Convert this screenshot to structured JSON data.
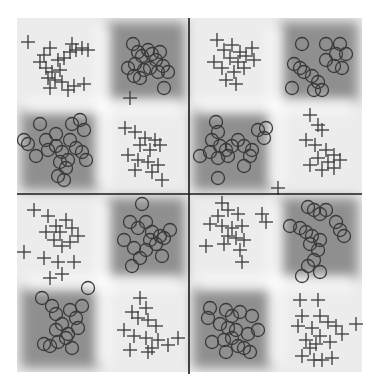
{
  "chart_data": {
    "type": "scatter",
    "title": "",
    "xlabel": "",
    "ylabel": "",
    "grid": false,
    "legend": null,
    "background": "decision-region heatmap (grayscale)",
    "colors": {
      "region_dark": "#8f8f8f",
      "region_light": "#ececec",
      "boundary_light": "#ffffff",
      "marker": "#3a3a3a",
      "divider": "#1a1a1a"
    },
    "plot_box": {
      "x0": 17,
      "y0": 18,
      "x1": 362,
      "y1": 372
    },
    "dividers": {
      "vertical_x": 189,
      "horizontal_y": 194
    },
    "series": [
      {
        "name": "class-plus",
        "marker": "plus",
        "points": [
          [
            28,
            42
          ],
          [
            44,
            55
          ],
          [
            50,
            48
          ],
          [
            58,
            60
          ],
          [
            46,
            68
          ],
          [
            52,
            72
          ],
          [
            60,
            70
          ],
          [
            64,
            58
          ],
          [
            70,
            52
          ],
          [
            76,
            50
          ],
          [
            82,
            48
          ],
          [
            88,
            50
          ],
          [
            72,
            44
          ],
          [
            40,
            62
          ],
          [
            48,
            78
          ],
          [
            55,
            80
          ],
          [
            62,
            82
          ],
          [
            50,
            88
          ],
          [
            68,
            90
          ],
          [
            74,
            86
          ],
          [
            84,
            84
          ],
          [
            130,
            98
          ],
          [
            125,
            128
          ],
          [
            135,
            132
          ],
          [
            145,
            138
          ],
          [
            155,
            140
          ],
          [
            140,
            145
          ],
          [
            150,
            150
          ],
          [
            160,
            145
          ],
          [
            128,
            155
          ],
          [
            138,
            160
          ],
          [
            148,
            162
          ],
          [
            158,
            165
          ],
          [
            135,
            170
          ],
          [
            152,
            172
          ],
          [
            162,
            180
          ],
          [
            217,
            40
          ],
          [
            224,
            50
          ],
          [
            232,
            45
          ],
          [
            240,
            52
          ],
          [
            230,
            58
          ],
          [
            238,
            62
          ],
          [
            246,
            56
          ],
          [
            214,
            62
          ],
          [
            222,
            68
          ],
          [
            234,
            72
          ],
          [
            244,
            68
          ],
          [
            226,
            80
          ],
          [
            236,
            84
          ],
          [
            252,
            48
          ],
          [
            254,
            60
          ],
          [
            310,
            115
          ],
          [
            318,
            125
          ],
          [
            322,
            130
          ],
          [
            306,
            140
          ],
          [
            315,
            145
          ],
          [
            326,
            150
          ],
          [
            334,
            155
          ],
          [
            318,
            158
          ],
          [
            328,
            162
          ],
          [
            310,
            165
          ],
          [
            322,
            170
          ],
          [
            334,
            168
          ],
          [
            340,
            160
          ],
          [
            278,
            188
          ],
          [
            34,
            210
          ],
          [
            48,
            216
          ],
          [
            56,
            226
          ],
          [
            60,
            232
          ],
          [
            66,
            220
          ],
          [
            72,
            228
          ],
          [
            78,
            236
          ],
          [
            46,
            232
          ],
          [
            54,
            240
          ],
          [
            62,
            246
          ],
          [
            70,
            242
          ],
          [
            24,
            252
          ],
          [
            44,
            258
          ],
          [
            58,
            262
          ],
          [
            74,
            262
          ],
          [
            50,
            278
          ],
          [
            62,
            274
          ],
          [
            140,
            298
          ],
          [
            146,
            308
          ],
          [
            132,
            312
          ],
          [
            138,
            318
          ],
          [
            148,
            320
          ],
          [
            156,
            326
          ],
          [
            124,
            330
          ],
          [
            134,
            336
          ],
          [
            146,
            338
          ],
          [
            158,
            340
          ],
          [
            168,
            345
          ],
          [
            130,
            350
          ],
          [
            148,
            352
          ],
          [
            152,
            348
          ],
          [
            178,
            338
          ],
          [
            222,
            203
          ],
          [
            218,
            216
          ],
          [
            228,
            210
          ],
          [
            238,
            214
          ],
          [
            210,
            224
          ],
          [
            222,
            226
          ],
          [
            232,
            228
          ],
          [
            242,
            226
          ],
          [
            228,
            236
          ],
          [
            236,
            238
          ],
          [
            244,
            240
          ],
          [
            206,
            246
          ],
          [
            224,
            244
          ],
          [
            240,
            250
          ],
          [
            262,
            214
          ],
          [
            266,
            222
          ],
          [
            242,
            262
          ],
          [
            300,
            300
          ],
          [
            318,
            300
          ],
          [
            302,
            316
          ],
          [
            320,
            316
          ],
          [
            328,
            322
          ],
          [
            336,
            326
          ],
          [
            298,
            326
          ],
          [
            312,
            328
          ],
          [
            320,
            336
          ],
          [
            306,
            340
          ],
          [
            316,
            344
          ],
          [
            330,
            342
          ],
          [
            342,
            334
          ],
          [
            356,
            324
          ],
          [
            302,
            356
          ],
          [
            314,
            360
          ],
          [
            322,
            360
          ],
          [
            332,
            358
          ],
          [
            310,
            348
          ]
        ]
      },
      {
        "name": "class-circle",
        "marker": "circle",
        "points": [
          [
            133,
            44
          ],
          [
            138,
            52
          ],
          [
            142,
            56
          ],
          [
            148,
            50
          ],
          [
            152,
            54
          ],
          [
            156,
            60
          ],
          [
            160,
            52
          ],
          [
            163,
            66
          ],
          [
            135,
            64
          ],
          [
            128,
            68
          ],
          [
            144,
            70
          ],
          [
            150,
            68
          ],
          [
            158,
            72
          ],
          [
            134,
            76
          ],
          [
            140,
            78
          ],
          [
            168,
            72
          ],
          [
            164,
            88
          ],
          [
            40,
            124
          ],
          [
            24,
            140
          ],
          [
            28,
            144
          ],
          [
            46,
            140
          ],
          [
            56,
            134
          ],
          [
            72,
            124
          ],
          [
            80,
            120
          ],
          [
            84,
            130
          ],
          [
            48,
            150
          ],
          [
            56,
            146
          ],
          [
            62,
            152
          ],
          [
            68,
            160
          ],
          [
            60,
            162
          ],
          [
            76,
            148
          ],
          [
            82,
            152
          ],
          [
            70,
            140
          ],
          [
            86,
            160
          ],
          [
            66,
            168
          ],
          [
            58,
            176
          ],
          [
            64,
            180
          ],
          [
            36,
            156
          ],
          [
            302,
            44
          ],
          [
            326,
            44
          ],
          [
            340,
            44
          ],
          [
            336,
            54
          ],
          [
            346,
            54
          ],
          [
            326,
            60
          ],
          [
            334,
            66
          ],
          [
            342,
            68
          ],
          [
            294,
            64
          ],
          [
            300,
            68
          ],
          [
            304,
            72
          ],
          [
            312,
            76
          ],
          [
            318,
            82
          ],
          [
            314,
            90
          ],
          [
            292,
            88
          ],
          [
            322,
            90
          ],
          [
            216,
            122
          ],
          [
            218,
            132
          ],
          [
            212,
            140
          ],
          [
            220,
            146
          ],
          [
            226,
            150
          ],
          [
            232,
            146
          ],
          [
            238,
            140
          ],
          [
            244,
            146
          ],
          [
            252,
            150
          ],
          [
            258,
            130
          ],
          [
            266,
            128
          ],
          [
            264,
            138
          ],
          [
            200,
            156
          ],
          [
            210,
            152
          ],
          [
            218,
            158
          ],
          [
            228,
            156
          ],
          [
            250,
            156
          ],
          [
            244,
            166
          ],
          [
            218,
            178
          ],
          [
            142,
            204
          ],
          [
            130,
            222
          ],
          [
            138,
            228
          ],
          [
            146,
            222
          ],
          [
            152,
            232
          ],
          [
            160,
            236
          ],
          [
            170,
            230
          ],
          [
            124,
            240
          ],
          [
            134,
            248
          ],
          [
            146,
            250
          ],
          [
            156,
            244
          ],
          [
            164,
            238
          ],
          [
            132,
            266
          ],
          [
            140,
            258
          ],
          [
            162,
            256
          ],
          [
            150,
            240
          ],
          [
            88,
            288
          ],
          [
            42,
            298
          ],
          [
            52,
            306
          ],
          [
            56,
            314
          ],
          [
            70,
            310
          ],
          [
            76,
            318
          ],
          [
            62,
            324
          ],
          [
            56,
            330
          ],
          [
            68,
            334
          ],
          [
            78,
            328
          ],
          [
            82,
            306
          ],
          [
            58,
            342
          ],
          [
            66,
            338
          ],
          [
            44,
            344
          ],
          [
            50,
            346
          ],
          [
            72,
            348
          ],
          [
            308,
            207
          ],
          [
            314,
            210
          ],
          [
            320,
            214
          ],
          [
            326,
            210
          ],
          [
            336,
            222
          ],
          [
            340,
            230
          ],
          [
            344,
            236
          ],
          [
            290,
            226
          ],
          [
            300,
            228
          ],
          [
            306,
            232
          ],
          [
            312,
            236
          ],
          [
            320,
            240
          ],
          [
            310,
            244
          ],
          [
            318,
            250
          ],
          [
            314,
            260
          ],
          [
            308,
            266
          ],
          [
            320,
            272
          ],
          [
            302,
            276
          ],
          [
            210,
            308
          ],
          [
            208,
            318
          ],
          [
            226,
            310
          ],
          [
            232,
            316
          ],
          [
            240,
            312
          ],
          [
            252,
            316
          ],
          [
            258,
            330
          ],
          [
            220,
            324
          ],
          [
            228,
            328
          ],
          [
            236,
            330
          ],
          [
            248,
            334
          ],
          [
            212,
            342
          ],
          [
            224,
            340
          ],
          [
            238,
            346
          ],
          [
            244,
            348
          ],
          [
            250,
            352
          ],
          [
            226,
            352
          ],
          [
            232,
            338
          ]
        ]
      }
    ],
    "regions": [
      {
        "label": "top-left quadrant",
        "dark_cells": [
          "top-right",
          "bottom-left"
        ],
        "light_cells": [
          "top-left",
          "bottom-right"
        ]
      },
      {
        "label": "top-right quadrant",
        "dark_cells": [
          "top-right",
          "bottom-left"
        ],
        "light_cells": [
          "top-left",
          "bottom-right"
        ]
      },
      {
        "label": "bottom-left quadrant",
        "dark_cells": [
          "top-right",
          "bottom-left"
        ],
        "light_cells": [
          "top-left",
          "bottom-right"
        ]
      },
      {
        "label": "bottom-right quadrant",
        "dark_cells": [
          "top-right",
          "bottom-left"
        ],
        "light_cells": [
          "top-left",
          "bottom-right"
        ]
      }
    ]
  }
}
